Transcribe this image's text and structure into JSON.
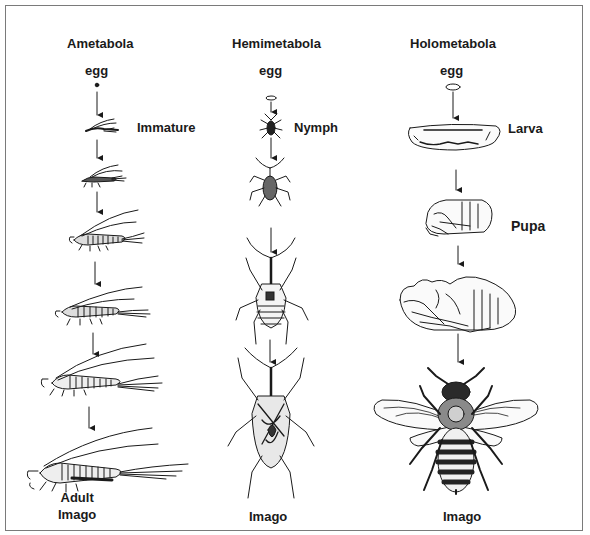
{
  "diagram": {
    "type": "insect-metamorphosis-comparison",
    "columns": [
      {
        "id": "ametabola",
        "title": "Ametabola",
        "egg_label": "egg",
        "stage_label": "Immature",
        "final_label_line1": "Adult",
        "final_label_line2": "Imago",
        "stages": [
          "egg",
          "immature",
          "instar-2",
          "instar-3",
          "instar-4",
          "instar-5",
          "adult"
        ]
      },
      {
        "id": "hemimetabola",
        "title": "Hemimetabola",
        "egg_label": "egg",
        "stage_label": "Nymph",
        "final_label": "Imago",
        "stages": [
          "egg",
          "nymph-1",
          "nymph-2",
          "nymph-3",
          "adult"
        ]
      },
      {
        "id": "holometabola",
        "title": "Holometabola",
        "egg_label": "egg",
        "stage_label": "Larva",
        "pupa_label": "Pupa",
        "final_label": "Imago",
        "stages": [
          "egg",
          "larva",
          "pupa",
          "pharate-adult",
          "adult-bee"
        ]
      }
    ],
    "colors": {
      "ink": "#1a1a1a",
      "frame": "#7a7a7a",
      "background": "#ffffff"
    }
  }
}
